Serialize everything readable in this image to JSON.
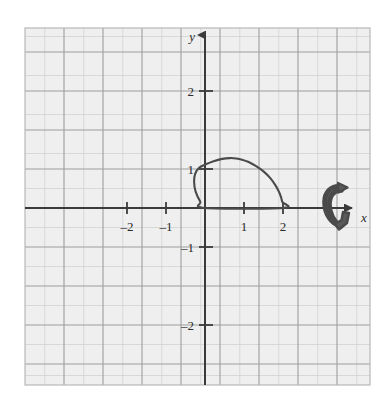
{
  "figure": {
    "name": "cartesian-grid-with-rotated-region",
    "background_color": "#ffffff",
    "plot_background_color": "#efefef",
    "grid_minor_color": "#cfcfcf",
    "grid_major_color": "#9a9a9a",
    "axis_color": "#3a3a3a",
    "curve_color": "#4a4a4a",
    "rotation_symbol_color": "#555555"
  },
  "axes": {
    "x_label": "x",
    "y_label": "y",
    "x_ticks": [
      {
        "value": -2,
        "label": "–2"
      },
      {
        "value": -1,
        "label": "–1"
      },
      {
        "value": 1,
        "label": "1"
      },
      {
        "value": 2,
        "label": "2"
      }
    ],
    "y_ticks": [
      {
        "value": 2,
        "label": "2"
      },
      {
        "value": 1,
        "label": "1"
      },
      {
        "value": -1,
        "label": "–1"
      },
      {
        "value": -2,
        "label": "–2"
      }
    ]
  },
  "chart_data": {
    "type": "line",
    "title": "",
    "xlabel": "x",
    "ylabel": "y",
    "xlim": [
      -2.6,
      2.9
    ],
    "ylim": [
      -2.65,
      2.9
    ],
    "grid": true,
    "legend": null,
    "annotations": [
      {
        "name": "rotation-about-x-axis-arrow",
        "text": "",
        "x": 2.55,
        "y": 0.05,
        "description": "curved arrow indicating revolution about the x-axis"
      }
    ],
    "series": [
      {
        "name": "closed-loop-curve",
        "closed": true,
        "x": [
          0.0,
          -0.12,
          -0.24,
          -0.28,
          -0.25,
          -0.15,
          0.02,
          0.22,
          0.44,
          0.64,
          0.8,
          0.95,
          1.12,
          1.3,
          1.5,
          1.68,
          1.82,
          1.92,
          1.98,
          2.0
        ],
        "y": [
          0.0,
          0.16,
          0.42,
          0.68,
          0.88,
          1.03,
          1.12,
          1.2,
          1.26,
          1.28,
          1.27,
          1.24,
          1.18,
          1.08,
          0.94,
          0.76,
          0.56,
          0.36,
          0.16,
          0.0
        ]
      }
    ]
  }
}
